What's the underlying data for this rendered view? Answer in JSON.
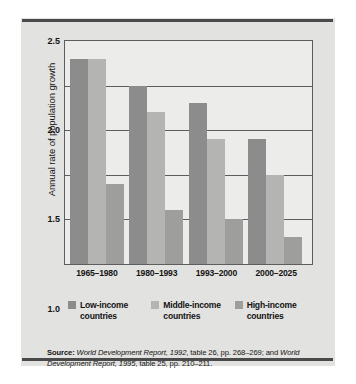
{
  "chart_data": {
    "type": "bar",
    "title": "",
    "xlabel": "",
    "ylabel": "Annual rate of population growth",
    "ylim": [
      0,
      2.5
    ],
    "yticks": [
      "0",
      "0.5",
      "1.0",
      "1.5",
      "2.0",
      "2.5"
    ],
    "ytick_values": [
      0,
      0.5,
      1.0,
      1.5,
      2.0,
      2.5
    ],
    "grid": true,
    "legend_position": "bottom",
    "categories": [
      "1965–1980",
      "1980–1993",
      "1993–2000",
      "2000–2025"
    ],
    "series": [
      {
        "name": "Low-income countries",
        "color": "#8c8c8c",
        "values": [
          2.3,
          2.0,
          1.8,
          1.4
        ]
      },
      {
        "name": "Middle-income countries",
        "color": "#b4b4b2",
        "values": [
          2.3,
          1.7,
          1.4,
          1.0
        ]
      },
      {
        "name": "High-income countries",
        "color": "#9e9e9c",
        "values": [
          0.9,
          0.6,
          0.5,
          0.3
        ]
      }
    ]
  },
  "legend": {
    "items": [
      {
        "line1": "Low-income",
        "line2": "countries"
      },
      {
        "line1": "Middle-income",
        "line2": "countries"
      },
      {
        "line1": "High-income",
        "line2": "countries"
      }
    ]
  },
  "source": {
    "label": "Source:",
    "part1": " World Development Report, 1992",
    "part2": ", table 26, pp. 268–269; and ",
    "part3": "World Development Report, 1995",
    "part4": ", table 25, pp. 210–211."
  },
  "colors": {
    "figure_background": "#e2e2e0",
    "plot_background": "#ececeb",
    "rule": "#4a4a4a",
    "axis": "#5d5d5d",
    "text": "#141414"
  }
}
